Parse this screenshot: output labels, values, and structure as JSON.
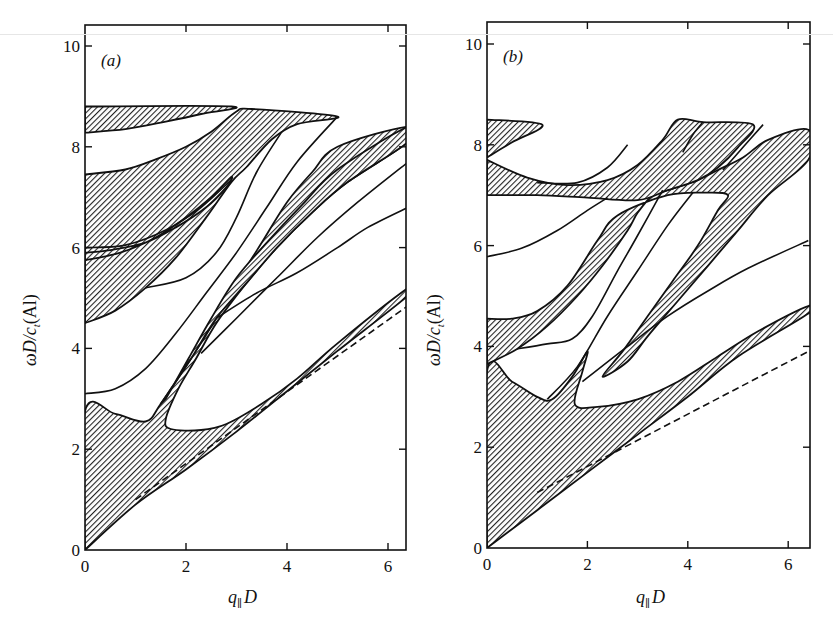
{
  "chart_data": [
    {
      "type": "area",
      "panel": "(a)",
      "title": "",
      "xlabel": "q∥D",
      "ylabel": "ωD/c_t(Al)",
      "xlim": [
        0,
        6.4
      ],
      "ylim": [
        0,
        10.4
      ],
      "xticks": [
        0,
        2,
        4,
        6
      ],
      "yticks": [
        0,
        2,
        4,
        6,
        8,
        10
      ],
      "grid": false,
      "legend": null,
      "hatched_regions": [
        {
          "name": "lowest band",
          "points": [
            [
              0,
              0
            ],
            [
              0,
              2.75
            ],
            [
              0.6,
              2.7
            ],
            [
              1.2,
              2.55
            ],
            [
              1.5,
              2.9
            ],
            [
              2.1,
              3.8
            ],
            [
              2.6,
              4.6
            ],
            [
              3.0,
              5.3
            ],
            [
              3.5,
              6.1
            ],
            [
              4.0,
              6.9
            ],
            [
              4.5,
              7.5
            ],
            [
              5.0,
              8.0
            ],
            [
              6.4,
              8.4
            ],
            [
              6.4,
              8.1
            ],
            [
              5.2,
              7.3
            ],
            [
              4.5,
              6.7
            ],
            [
              3.8,
              6.0
            ],
            [
              3.2,
              5.3
            ],
            [
              2.6,
              4.5
            ],
            [
              2.2,
              3.8
            ],
            [
              1.85,
              3.2
            ],
            [
              1.6,
              2.6
            ],
            [
              1.7,
              2.4
            ],
            [
              2.3,
              2.38
            ],
            [
              2.8,
              2.5
            ],
            [
              3.5,
              2.9
            ],
            [
              4.2,
              3.4
            ],
            [
              5.0,
              4.1
            ],
            [
              6.4,
              5.2
            ],
            [
              6.4,
              5.05
            ],
            [
              5.0,
              3.95
            ],
            [
              4.0,
              3.15
            ],
            [
              3.0,
              2.35
            ],
            [
              2.0,
              1.6
            ],
            [
              1.0,
              0.9
            ],
            [
              0,
              0
            ]
          ]
        },
        {
          "name": "upper band left",
          "points": [
            [
              0,
              4.5
            ],
            [
              0.6,
              4.75
            ],
            [
              1.2,
              5.2
            ],
            [
              1.8,
              5.8
            ],
            [
              2.4,
              6.6
            ],
            [
              2.9,
              7.3
            ],
            [
              3.2,
              7.6
            ],
            [
              3.7,
              8.15
            ],
            [
              4.2,
              8.45
            ],
            [
              5.0,
              8.6
            ],
            [
              3.3,
              8.75
            ],
            [
              3.0,
              8.7
            ],
            [
              2.5,
              8.3
            ],
            [
              2.0,
              8.0
            ],
            [
              1.4,
              7.75
            ],
            [
              0.8,
              7.55
            ],
            [
              0,
              7.45
            ]
          ]
        },
        {
          "name": "upper band inner",
          "points": [
            [
              0,
              5.75
            ],
            [
              0.7,
              5.9
            ],
            [
              1.4,
              6.2
            ],
            [
              2.0,
              6.6
            ],
            [
              2.5,
              7.0
            ],
            [
              2.9,
              7.4
            ],
            [
              2.8,
              7.2
            ],
            [
              2.4,
              6.8
            ],
            [
              1.8,
              6.4
            ],
            [
              1.2,
              6.1
            ],
            [
              0.5,
              5.95
            ],
            [
              0,
              5.9
            ]
          ]
        },
        {
          "name": "top band",
          "points": [
            [
              0,
              8.28
            ],
            [
              0.8,
              8.35
            ],
            [
              1.6,
              8.5
            ],
            [
              2.3,
              8.65
            ],
            [
              2.9,
              8.8
            ],
            [
              0,
              8.8
            ]
          ]
        },
        {
          "name": "middle diagonal band",
          "points": [
            [
              1.5,
              2.9
            ],
            [
              2.1,
              3.8
            ],
            [
              2.6,
              4.6
            ],
            [
              3.2,
              5.3
            ],
            [
              3.8,
              6.0
            ],
            [
              4.5,
              6.7
            ],
            [
              5.2,
              7.3
            ],
            [
              6.4,
              8.1
            ],
            [
              6.4,
              8.4
            ],
            [
              5.0,
              7.55
            ],
            [
              4.3,
              6.85
            ],
            [
              3.6,
              6.1
            ],
            [
              3.0,
              5.4
            ],
            [
              2.5,
              4.6
            ],
            [
              2.05,
              3.8
            ],
            [
              1.6,
              3.0
            ]
          ]
        }
      ],
      "curves": [
        {
          "name": "curve from 3.1",
          "points": [
            [
              0,
              3.1
            ],
            [
              0.6,
              3.2
            ],
            [
              1.2,
              3.6
            ],
            [
              1.8,
              4.3
            ],
            [
              2.4,
              5.1
            ],
            [
              3.0,
              5.9
            ],
            [
              3.6,
              6.8
            ],
            [
              4.2,
              7.7
            ],
            [
              5.0,
              8.6
            ]
          ]
        },
        {
          "name": "curve from 5.2",
          "points": [
            [
              1.2,
              5.2
            ],
            [
              2.0,
              5.4
            ],
            [
              2.6,
              5.9
            ],
            [
              3.0,
              6.6
            ],
            [
              3.4,
              7.5
            ],
            [
              3.9,
              8.3
            ]
          ]
        },
        {
          "name": "curve near 6.0",
          "points": [
            [
              0,
              6.0
            ],
            [
              0.8,
              6.05
            ],
            [
              1.6,
              6.35
            ],
            [
              2.3,
              6.8
            ],
            [
              2.9,
              7.35
            ]
          ]
        },
        {
          "name": "curve to 6.8",
          "points": [
            [
              2.6,
              4.6
            ],
            [
              3.4,
              5.1
            ],
            [
              4.2,
              5.5
            ],
            [
              5.0,
              6.0
            ],
            [
              5.6,
              6.4
            ],
            [
              6.4,
              6.8
            ]
          ]
        },
        {
          "name": "curve to 7.7",
          "points": [
            [
              2.3,
              3.9
            ],
            [
              3.0,
              4.6
            ],
            [
              3.8,
              5.4
            ],
            [
              4.6,
              6.2
            ],
            [
              5.4,
              6.9
            ],
            [
              6.4,
              7.7
            ]
          ]
        }
      ],
      "dashed_line": {
        "name": "bulk transverse",
        "points": [
          [
            1.0,
            1.0
          ],
          [
            6.4,
            4.85
          ]
        ]
      }
    },
    {
      "type": "area",
      "panel": "(b)",
      "title": "",
      "xlabel": "q∥D",
      "ylabel": "ωD/c_t(Al)",
      "xlim": [
        0,
        6.4
      ],
      "ylim": [
        0,
        10.4
      ],
      "xticks": [
        0,
        2,
        4,
        6
      ],
      "yticks": [
        0,
        2,
        4,
        6,
        8,
        10
      ],
      "grid": false,
      "legend": null,
      "hatched_regions": [
        {
          "name": "lowest band",
          "points": [
            [
              0,
              0
            ],
            [
              0,
              3.5
            ],
            [
              0.5,
              3.3
            ],
            [
              1.0,
              3.0
            ],
            [
              1.3,
              2.95
            ],
            [
              1.7,
              3.4
            ],
            [
              2.0,
              3.9
            ],
            [
              1.9,
              3.5
            ],
            [
              1.75,
              2.85
            ],
            [
              2.2,
              2.8
            ],
            [
              3.0,
              2.95
            ],
            [
              3.8,
              3.3
            ],
            [
              4.6,
              3.8
            ],
            [
              5.4,
              4.3
            ],
            [
              6.4,
              4.8
            ],
            [
              6.4,
              4.65
            ],
            [
              5.0,
              3.8
            ],
            [
              4.0,
              3.0
            ],
            [
              3.0,
              2.25
            ],
            [
              2.0,
              1.5
            ],
            [
              1.0,
              0.75
            ],
            [
              0,
              0
            ]
          ]
        },
        {
          "name": "second band",
          "points": [
            [
              0,
              3.65
            ],
            [
              0.6,
              3.95
            ],
            [
              1.2,
              4.4
            ],
            [
              1.8,
              5.0
            ],
            [
              2.3,
              5.6
            ],
            [
              2.8,
              6.3
            ],
            [
              3.0,
              6.65
            ],
            [
              3.3,
              7.0
            ],
            [
              3.6,
              7.1
            ],
            [
              4.2,
              7.3
            ],
            [
              4.6,
              7.5
            ],
            [
              5.1,
              7.75
            ],
            [
              5.6,
              8.1
            ],
            [
              6.4,
              8.3
            ],
            [
              6.4,
              7.7
            ],
            [
              5.6,
              7.0
            ],
            [
              5.0,
              6.3
            ],
            [
              4.4,
              5.6
            ],
            [
              3.8,
              4.9
            ],
            [
              3.2,
              4.2
            ],
            [
              2.8,
              3.7
            ],
            [
              2.3,
              3.4
            ],
            [
              2.7,
              3.9
            ],
            [
              3.2,
              4.6
            ],
            [
              3.7,
              5.3
            ],
            [
              4.2,
              6.0
            ],
            [
              4.6,
              6.7
            ],
            [
              4.8,
              7.0
            ],
            [
              4.4,
              7.05
            ],
            [
              3.6,
              7.0
            ],
            [
              2.6,
              6.6
            ],
            [
              2.2,
              6.1
            ],
            [
              1.6,
              5.2
            ],
            [
              1.0,
              4.7
            ],
            [
              0.5,
              4.55
            ],
            [
              0,
              4.55
            ]
          ]
        },
        {
          "name": "horizontal band",
          "points": [
            [
              0,
              7.7
            ],
            [
              0.8,
              7.35
            ],
            [
              1.6,
              7.2
            ],
            [
              2.4,
              7.3
            ],
            [
              3.0,
              7.6
            ],
            [
              3.5,
              8.1
            ],
            [
              3.8,
              8.5
            ],
            [
              4.3,
              8.45
            ],
            [
              5.3,
              8.4
            ],
            [
              5.0,
              7.95
            ],
            [
              4.6,
              7.55
            ],
            [
              4.2,
              7.3
            ],
            [
              3.6,
              7.1
            ],
            [
              3.0,
              6.9
            ],
            [
              2.0,
              6.95
            ],
            [
              1.0,
              7.0
            ],
            [
              0,
              7.0
            ]
          ]
        },
        {
          "name": "top left wedge",
          "points": [
            [
              0,
              7.75
            ],
            [
              0.5,
              8.05
            ],
            [
              1.1,
              8.4
            ],
            [
              0,
              8.5
            ]
          ]
        }
      ],
      "curves": [
        {
          "name": "curve from 5.8",
          "points": [
            [
              0,
              5.78
            ],
            [
              0.7,
              5.95
            ],
            [
              1.4,
              6.3
            ],
            [
              2.0,
              6.7
            ],
            [
              2.4,
              6.95
            ]
          ]
        },
        {
          "name": "curve to 8.0",
          "points": [
            [
              1.0,
              7.25
            ],
            [
              1.8,
              7.25
            ],
            [
              2.4,
              7.55
            ],
            [
              2.8,
              8.0
            ]
          ]
        },
        {
          "name": "curve through 4.1",
          "points": [
            [
              0.6,
              3.95
            ],
            [
              1.2,
              4.05
            ],
            [
              1.7,
              4.15
            ],
            [
              2.1,
              4.6
            ],
            [
              2.6,
              5.5
            ],
            [
              3.0,
              6.2
            ],
            [
              3.5,
              7.1
            ]
          ]
        },
        {
          "name": "curve from 2.9",
          "points": [
            [
              1.2,
              2.95
            ],
            [
              1.8,
              3.6
            ],
            [
              2.4,
              4.6
            ],
            [
              3.0,
              5.5
            ],
            [
              3.6,
              6.4
            ],
            [
              4.1,
              7.05
            ]
          ]
        },
        {
          "name": "curve to 6.1",
          "points": [
            [
              1.9,
              3.3
            ],
            [
              2.8,
              4.0
            ],
            [
              3.6,
              4.6
            ],
            [
              4.4,
              5.1
            ],
            [
              5.2,
              5.55
            ],
            [
              6.4,
              6.1
            ]
          ]
        },
        {
          "name": "curve to 8.4 spike",
          "points": [
            [
              4.7,
              7.5
            ],
            [
              5.1,
              7.95
            ],
            [
              5.5,
              8.4
            ]
          ]
        },
        {
          "name": "curve to 8.5 spike",
          "points": [
            [
              3.9,
              7.85
            ],
            [
              4.1,
              8.2
            ],
            [
              4.3,
              8.45
            ]
          ]
        }
      ],
      "dashed_line": {
        "name": "bulk transverse",
        "points": [
          [
            1.0,
            1.1
          ],
          [
            6.4,
            3.9
          ]
        ]
      }
    }
  ],
  "panels": {
    "a": {
      "tag": "(a)",
      "xlabel_q": "q",
      "xlabel_sub": "∥",
      "xlabel_D": "D",
      "ylabel_main": "ωD/c",
      "ylabel_sub": "t",
      "ylabel_tail": "(Al)",
      "xticks": [
        "0",
        "2",
        "4",
        "6"
      ],
      "yticks": [
        "0",
        "2",
        "4",
        "6",
        "8",
        "10"
      ]
    },
    "b": {
      "tag": "(b)",
      "xlabel_q": "q",
      "xlabel_sub": "∥",
      "xlabel_D": "D",
      "ylabel_main": "ωD/c",
      "ylabel_sub": "t",
      "ylabel_tail": "(Al)",
      "xticks": [
        "0",
        "2",
        "4",
        "6"
      ],
      "yticks": [
        "0",
        "2",
        "4",
        "6",
        "8",
        "10"
      ]
    }
  },
  "colors": {
    "ink": "#111111",
    "background": "#ffffff",
    "hatch": "#222222"
  }
}
